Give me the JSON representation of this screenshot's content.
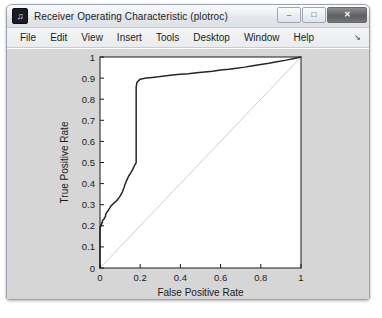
{
  "window": {
    "title": "Receiver Operating Characteristic (plotroc)",
    "icon": "matlab-figure-icon",
    "controls": {
      "minimize": "–",
      "maximize": "□",
      "close": "✕"
    }
  },
  "menubar": {
    "items": [
      {
        "label": "File"
      },
      {
        "label": "Edit"
      },
      {
        "label": "View"
      },
      {
        "label": "Insert"
      },
      {
        "label": "Tools"
      },
      {
        "label": "Desktop"
      },
      {
        "label": "Window"
      },
      {
        "label": "Help"
      }
    ],
    "overflow_arrow": "↘"
  },
  "colors": {
    "figure_background": "#d6d6d6",
    "axes_background": "#ffffff",
    "roc_curve": "#262626",
    "chance_line": "#c8c8c8",
    "axis": "#1b1b1b"
  },
  "chart_data": {
    "type": "line",
    "title": "",
    "xlabel": "False Positive Rate",
    "ylabel": "True Positive Rate",
    "xlim": [
      0,
      1
    ],
    "ylim": [
      0,
      1
    ],
    "grid": false,
    "legend": null,
    "xticks": [
      0,
      0.2,
      0.4,
      0.6,
      0.8,
      1
    ],
    "xticklabels": [
      "0",
      "0.2",
      "0.4",
      "0.6",
      "0.8",
      "1"
    ],
    "yticks": [
      0,
      0.1,
      0.2,
      0.3,
      0.4,
      0.5,
      0.6,
      0.7,
      0.8,
      0.9,
      1
    ],
    "yticklabels": [
      "0",
      "0.1",
      "0.2",
      "0.3",
      "0.4",
      "0.5",
      "0.6",
      "0.7",
      "0.8",
      "0.9",
      "1"
    ],
    "series": [
      {
        "name": "ROC curve",
        "color": "#262626",
        "x": [
          0.0,
          0.0,
          0.004,
          0.004,
          0.008,
          0.008,
          0.012,
          0.012,
          0.016,
          0.02,
          0.024,
          0.028,
          0.028,
          0.033,
          0.037,
          0.041,
          0.045,
          0.049,
          0.053,
          0.057,
          0.061,
          0.065,
          0.07,
          0.074,
          0.078,
          0.082,
          0.086,
          0.09,
          0.094,
          0.098,
          0.102,
          0.107,
          0.111,
          0.115,
          0.119,
          0.123,
          0.127,
          0.131,
          0.135,
          0.139,
          0.143,
          0.148,
          0.152,
          0.156,
          0.16,
          0.164,
          0.168,
          0.172,
          0.176,
          0.18,
          0.18,
          0.18,
          0.18,
          0.184,
          0.2,
          0.23,
          0.26,
          0.29,
          0.32,
          0.36,
          0.4,
          0.44,
          0.48,
          0.52,
          0.56,
          0.6,
          0.64,
          0.68,
          0.72,
          0.76,
          0.8,
          0.84,
          0.88,
          0.92,
          0.96,
          1.0
        ],
        "y": [
          0.0,
          0.195,
          0.195,
          0.205,
          0.205,
          0.215,
          0.215,
          0.225,
          0.228,
          0.232,
          0.24,
          0.246,
          0.255,
          0.262,
          0.268,
          0.272,
          0.28,
          0.285,
          0.292,
          0.296,
          0.3,
          0.304,
          0.308,
          0.311,
          0.315,
          0.318,
          0.322,
          0.328,
          0.332,
          0.338,
          0.344,
          0.352,
          0.36,
          0.37,
          0.38,
          0.392,
          0.402,
          0.412,
          0.42,
          0.428,
          0.436,
          0.444,
          0.45,
          0.456,
          0.462,
          0.47,
          0.478,
          0.486,
          0.492,
          0.5,
          0.61,
          0.74,
          0.86,
          0.88,
          0.895,
          0.9,
          0.903,
          0.906,
          0.91,
          0.915,
          0.918,
          0.921,
          0.925,
          0.929,
          0.933,
          0.938,
          0.942,
          0.947,
          0.952,
          0.958,
          0.964,
          0.97,
          0.977,
          0.984,
          0.992,
          1.0
        ]
      },
      {
        "name": "chance diagonal",
        "color": "#c8c8c8",
        "x": [
          0,
          1
        ],
        "y": [
          0,
          1
        ]
      }
    ]
  }
}
